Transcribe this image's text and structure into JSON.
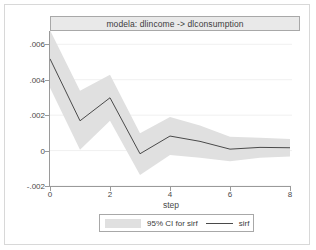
{
  "chart_data": {
    "type": "line",
    "title": "modela: dlincome -> dlconsumption",
    "xlabel": "step",
    "ylabel": "",
    "x": [
      0,
      1,
      2,
      3,
      4,
      5,
      6,
      7,
      8
    ],
    "xlim": [
      0,
      8
    ],
    "ylim": [
      -0.002,
      0.00675
    ],
    "grid": true,
    "legend_position": "bottom",
    "xticks": [
      0,
      2,
      4,
      6,
      8
    ],
    "xtick_labels": [
      "0",
      "2",
      "4",
      "6",
      "8"
    ],
    "yticks": [
      0.006,
      0.004,
      0.002,
      0,
      -0.002
    ],
    "ytick_labels": [
      ".006",
      ".004",
      ".002",
      "0",
      "-.002"
    ],
    "series": [
      {
        "name": "sirf",
        "kind": "line",
        "color": "#4a4a4a",
        "values": [
          0.00518,
          0.00168,
          0.00298,
          -0.00018,
          0.00082,
          0.00052,
          8e-05,
          0.00018,
          0.00016
        ]
      },
      {
        "name": "95% CI for sirf",
        "kind": "band",
        "color": "#e0e0e0",
        "upper": [
          0.0068,
          0.00338,
          0.00428,
          0.00098,
          0.0019,
          0.00142,
          0.00078,
          0.00072,
          0.00066
        ],
        "lower": [
          0.00355,
          5e-05,
          0.00168,
          -0.00138,
          -0.00025,
          -0.0004,
          -0.0006,
          -0.0004,
          -0.00034
        ]
      }
    ],
    "legend_entries": [
      {
        "label": "95% CI for sirf",
        "marker": "band",
        "color": "#e0e0e0"
      },
      {
        "label": "sirf",
        "marker": "line",
        "color": "#4a4a4a"
      }
    ]
  },
  "style": {
    "band_color": "#e0e0e0",
    "line_color": "#4a4a4a",
    "axis_color": "#9a9a9a",
    "grid_color": "#f0f0f0",
    "title_bar_bg": "#e9e9e9",
    "title_bar_border": "#a8a8a8",
    "text_color": "#3c3c3c",
    "page_bg": "#ffffff"
  }
}
